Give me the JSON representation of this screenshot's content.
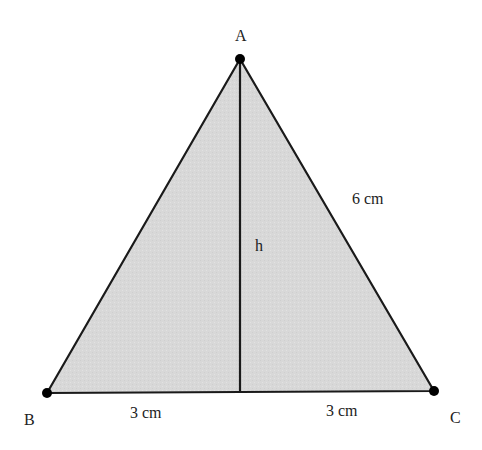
{
  "diagram": {
    "type": "equilateral-triangle-with-altitude",
    "colors": {
      "fill": "#d9d9d9",
      "stroke": "#1a1a1a",
      "point": "#000000",
      "text": "#222222"
    },
    "vertices": {
      "A": {
        "label": "A",
        "x": 240,
        "y": 59
      },
      "B": {
        "label": "B",
        "x": 47,
        "y": 393
      },
      "C": {
        "label": "C",
        "x": 434,
        "y": 391
      }
    },
    "altitude": {
      "label": "h",
      "from": "A",
      "foot": {
        "x": 240,
        "y": 392
      }
    },
    "measurements": {
      "side_AC": "6 cm",
      "base_left": "3 cm",
      "base_right": "3 cm"
    }
  }
}
